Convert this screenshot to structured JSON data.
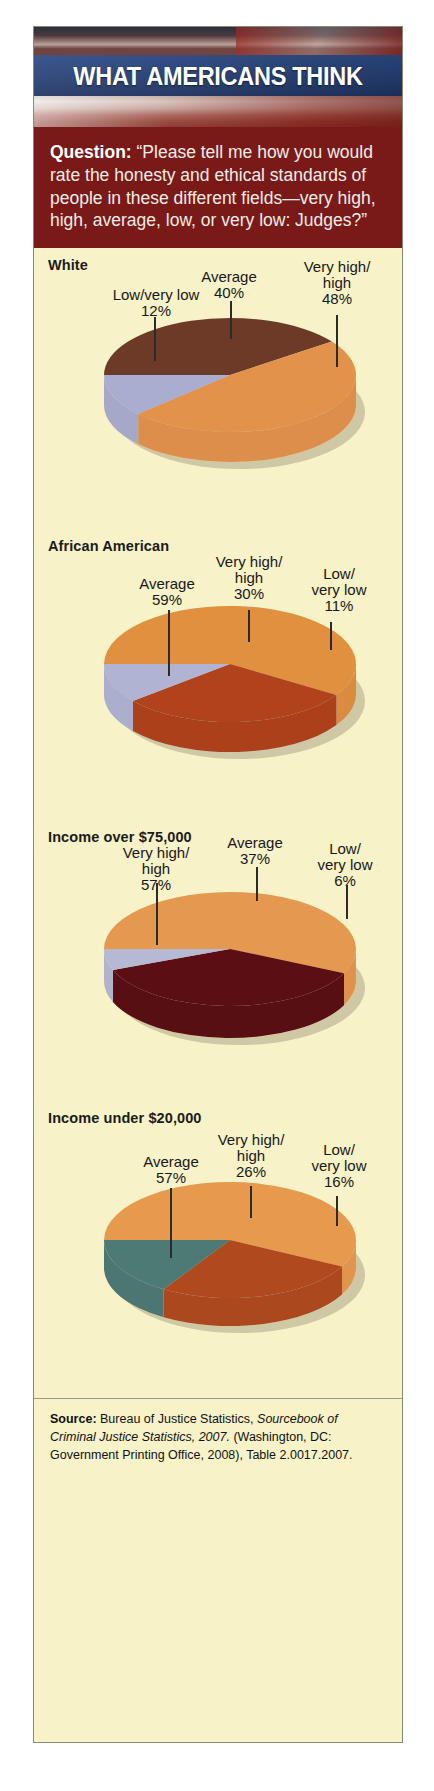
{
  "header": {
    "title": "WHAT AMERICANS THINK",
    "banner_blue": "#27407a",
    "banner_red": "#7a1a18"
  },
  "question": {
    "label": "Question:",
    "text": "“Please tell me how you would rate the honesty and ethical standards of people in these different fields—very high, high, average, low, or very low: Judges?”"
  },
  "source": {
    "label": "Source:",
    "part1": " Bureau of Justice Statistics, ",
    "italic1": "Sourcebook of Criminal Justice Statistics, 2007.",
    "part2": " (Washington, DC: Government Printing Office, 2008), Table 2.0017.2007."
  },
  "chart_data": [
    {
      "type": "pie",
      "title": "White",
      "categories": [
        "Average",
        "Very high/ high",
        "Low/very low"
      ],
      "labels": [
        {
          "name": "Low/very low",
          "value": 12,
          "value_text": "12%",
          "color": "#a9aed0"
        },
        {
          "name": "Average",
          "value": 40,
          "value_text": "40%",
          "color": "#6d3a28"
        },
        {
          "name": "Very high/ high",
          "value": 48,
          "value_text": "48%",
          "color": "#e3924c"
        }
      ],
      "values": [
        40,
        48,
        12
      ],
      "colors": [
        "#6d3a28",
        "#e3924c",
        "#a9aed0"
      ],
      "side_color": "#f2d9a2"
    },
    {
      "type": "pie",
      "title": "African American",
      "categories": [
        "Average",
        "Very high/ high",
        "Low/ very low"
      ],
      "labels": [
        {
          "name": "Average",
          "value": 59,
          "value_text": "59%",
          "color": "#e0903f"
        },
        {
          "name": "Very high/ high",
          "value": 30,
          "value_text": "30%",
          "color": "#b0421c"
        },
        {
          "name": "Low/ very low",
          "value": 11,
          "value_text": "11%",
          "color": "#b0b3d2"
        }
      ],
      "values": [
        59,
        30,
        11
      ],
      "colors": [
        "#e0903f",
        "#b0421c",
        "#b0b3d2"
      ],
      "side_color": "#c6d4e8"
    },
    {
      "type": "pie",
      "title": "Income over $75,000",
      "categories": [
        "Very high/ high",
        "Average",
        "Low/ very low"
      ],
      "labels": [
        {
          "name": "Very high/ high",
          "value": 57,
          "value_text": "57%",
          "color": "#e5984f"
        },
        {
          "name": "Average",
          "value": 37,
          "value_text": "37%",
          "color": "#5b0f14"
        },
        {
          "name": "Low/ very low",
          "value": 6,
          "value_text": "6%",
          "color": "#b6b9d3"
        }
      ],
      "values": [
        57,
        37,
        6
      ],
      "colors": [
        "#e5984f",
        "#5b0f14",
        "#b6b9d3"
      ],
      "side_color": "#f4dfab"
    },
    {
      "type": "pie",
      "title": "Income under $20,000",
      "categories": [
        "Average",
        "Very high/ high",
        "Low/ very low"
      ],
      "labels": [
        {
          "name": "Average",
          "value": 57,
          "value_text": "57%",
          "color": "#e79a4e"
        },
        {
          "name": "Very high/ high",
          "value": 26,
          "value_text": "26%",
          "color": "#b04a1e"
        },
        {
          "name": "Low/ very low",
          "value": 16,
          "value_text": "16%",
          "color": "#4d7a74"
        }
      ],
      "values": [
        57,
        26,
        16
      ],
      "colors": [
        "#e79a4e",
        "#b04a1e",
        "#4d7a74"
      ],
      "side_color": "#dde3dc"
    }
  ]
}
